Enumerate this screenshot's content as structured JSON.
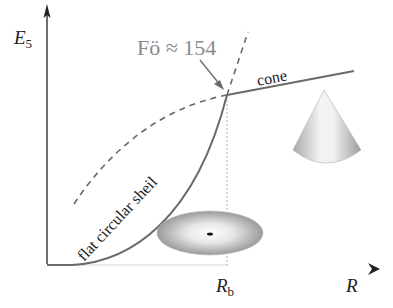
{
  "diagram": {
    "y_axis": {
      "label": "E",
      "subscript": "5"
    },
    "x_axis": {
      "label": "R"
    },
    "tick": {
      "label": "R",
      "subscript": "b"
    },
    "annotation": {
      "text": "Fö ≈ 154"
    },
    "curves": [
      {
        "name": "cone",
        "label": "cone",
        "style": "solid"
      },
      {
        "name": "flat-circular-shell",
        "label": "flat circular sheil",
        "style": "solid"
      },
      {
        "name": "cone-extension",
        "label": "",
        "style": "dashed"
      },
      {
        "name": "shell-extension",
        "label": "",
        "style": "dashed"
      }
    ],
    "shapes": [
      {
        "name": "cone-shape"
      },
      {
        "name": "disk-shape"
      }
    ],
    "colors": {
      "axis": "#222222",
      "curve": "#6a6a6a",
      "annotation": "#8a8a8a",
      "guide": "#b0b0b0"
    }
  }
}
